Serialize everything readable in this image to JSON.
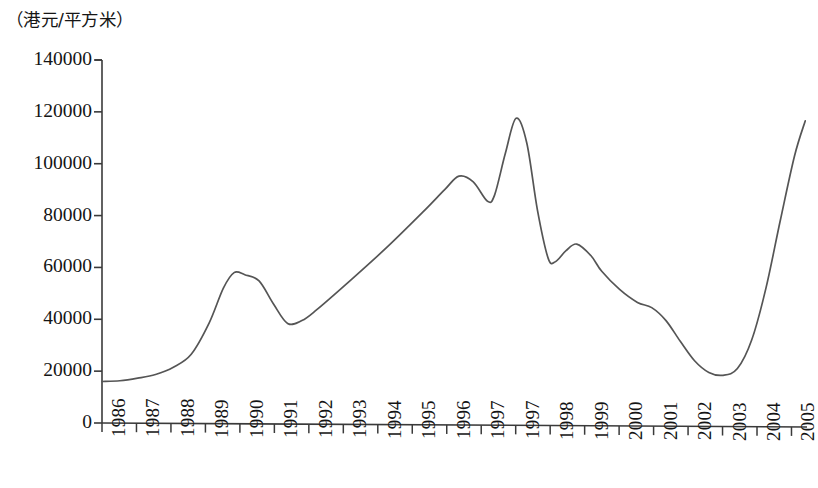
{
  "chart_data": {
    "type": "line",
    "title": "",
    "subtitle": "",
    "unit_caption": "（港元/平方米）",
    "xlabel": "",
    "ylabel": "",
    "ylim": [
      0,
      140000
    ],
    "grid": false,
    "legend": "none",
    "y_ticks": [
      140000,
      120000,
      100000,
      80000,
      60000,
      40000,
      20000,
      0
    ],
    "y_tick_labels": [
      "140000",
      "120000",
      "100000",
      "80000",
      "60000",
      "40000",
      "20000",
      "0"
    ],
    "x_tick_labels": [
      "1986",
      "1987",
      "1988",
      "1989",
      "1990",
      "1991",
      "1992",
      "1993",
      "1994",
      "1995",
      "1996",
      "1997",
      "1997",
      "1998",
      "1999",
      "2000",
      "2001",
      "2002",
      "2003",
      "2004",
      "2005"
    ],
    "line_color": "#555555",
    "axis_color": "#3a3a3a",
    "series": [
      {
        "name": "香港物业价格",
        "categories": [
          "1986",
          "1987",
          "1988",
          "1989",
          "1990",
          "1991",
          "1992",
          "1993",
          "1994",
          "1995",
          "1996",
          "1997",
          "1997",
          "1998",
          "1999",
          "2000",
          "2001",
          "2002",
          "2003",
          "2004",
          "2005"
        ],
        "values": [
          16000,
          17500,
          22500,
          45000,
          57000,
          38500,
          45500,
          56500,
          68500,
          82000,
          95500,
          86500,
          117500,
          62500,
          69000,
          53000,
          45500,
          37000,
          18500,
          30000,
          90000
        ]
      }
    ],
    "points": [
      {
        "x": 1986.0,
        "y": 16000
      },
      {
        "x": 1986.5,
        "y": 16300
      },
      {
        "x": 1987.0,
        "y": 17300
      },
      {
        "x": 1987.5,
        "y": 18700
      },
      {
        "x": 1988.0,
        "y": 21500
      },
      {
        "x": 1988.5,
        "y": 26500
      },
      {
        "x": 1989.0,
        "y": 38500
      },
      {
        "x": 1989.4,
        "y": 52000
      },
      {
        "x": 1989.7,
        "y": 58000
      },
      {
        "x": 1990.0,
        "y": 57200
      },
      {
        "x": 1990.4,
        "y": 54800
      },
      {
        "x": 1990.8,
        "y": 46000
      },
      {
        "x": 1991.2,
        "y": 38400
      },
      {
        "x": 1991.6,
        "y": 39500
      },
      {
        "x": 1992.0,
        "y": 43500
      },
      {
        "x": 1993.0,
        "y": 55500
      },
      {
        "x": 1994.0,
        "y": 68000
      },
      {
        "x": 1995.0,
        "y": 81500
      },
      {
        "x": 1995.6,
        "y": 90000
      },
      {
        "x": 1996.0,
        "y": 95200
      },
      {
        "x": 1996.4,
        "y": 93000
      },
      {
        "x": 1996.8,
        "y": 85500
      },
      {
        "x": 1997.0,
        "y": 88000
      },
      {
        "x": 1997.3,
        "y": 104000
      },
      {
        "x": 1997.6,
        "y": 117500
      },
      {
        "x": 1997.9,
        "y": 108000
      },
      {
        "x": 1998.2,
        "y": 82000
      },
      {
        "x": 1998.5,
        "y": 63500
      },
      {
        "x": 1998.7,
        "y": 62200
      },
      {
        "x": 1999.0,
        "y": 66500
      },
      {
        "x": 1999.3,
        "y": 69000
      },
      {
        "x": 1999.7,
        "y": 64500
      },
      {
        "x": 2000.0,
        "y": 58500
      },
      {
        "x": 2000.5,
        "y": 51500
      },
      {
        "x": 2001.0,
        "y": 46500
      },
      {
        "x": 2001.4,
        "y": 44500
      },
      {
        "x": 2001.8,
        "y": 39500
      },
      {
        "x": 2002.2,
        "y": 31500
      },
      {
        "x": 2002.6,
        "y": 24000
      },
      {
        "x": 2003.0,
        "y": 19500
      },
      {
        "x": 2003.4,
        "y": 18400
      },
      {
        "x": 2003.8,
        "y": 21000
      },
      {
        "x": 2004.2,
        "y": 32000
      },
      {
        "x": 2004.6,
        "y": 52000
      },
      {
        "x": 2005.0,
        "y": 78000
      },
      {
        "x": 2005.4,
        "y": 103000
      },
      {
        "x": 2005.7,
        "y": 116500
      }
    ],
    "annotations": {
      "peak_1997": 117500,
      "peak_1990": 58000,
      "peak_1996": 95200,
      "trough_1991": 38400,
      "trough_1998": 62200,
      "trough_2003": 18400,
      "start_1986": 16000,
      "end_2005": 116500
    },
    "axis_geometry": {
      "plot_left": 102,
      "plot_right": 807,
      "plot_top": 60,
      "plot_bottom": 423,
      "x_min": 1986,
      "x_max": 2005.75,
      "tick_count": 21
    }
  }
}
